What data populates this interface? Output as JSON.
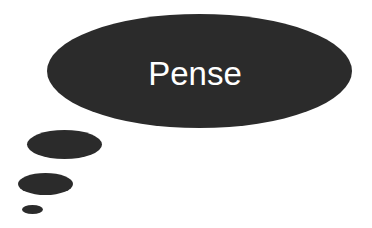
{
  "diagram": {
    "type": "thought-bubble",
    "bubble": {
      "label": "Pense",
      "fill": "#2b2b2b",
      "text_color": "#ffffff"
    },
    "trail": [
      {
        "name": "trail-bubble-large"
      },
      {
        "name": "trail-bubble-medium"
      },
      {
        "name": "trail-bubble-small"
      }
    ]
  }
}
